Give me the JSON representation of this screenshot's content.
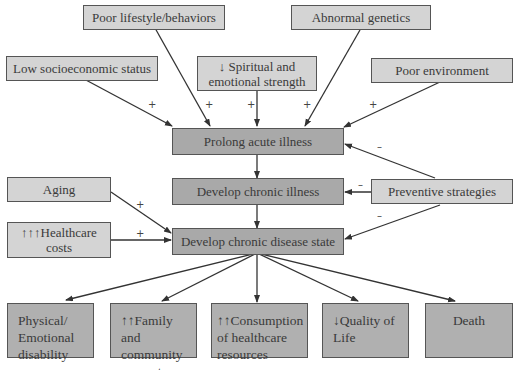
{
  "nodes": {
    "poor_lifestyle": "Poor lifestyle/behaviors",
    "abnormal_genetics": "Abnormal genetics",
    "low_ses": "Low socioeconomic status",
    "spiritual": "↓ Spiritual and emotional strength",
    "poor_environment": "Poor environment",
    "prolong_acute": "Prolong acute illness",
    "develop_chronic_illness": "Develop chronic illness",
    "preventive": "Preventive strategies",
    "aging": "Aging",
    "healthcare_costs": "↑↑↑Healthcare costs",
    "chronic_disease_state": "Develop chronic disease state",
    "physical_disability": "Physical/ Emotional disability",
    "family_support": "↑↑Family and community support care",
    "consumption": "↑↑Consumption of healthcare resources",
    "quality_of_life": "↓Quality of Life",
    "death": "Death"
  },
  "signs": {
    "plus": "+",
    "minus": "–"
  },
  "edges": [
    {
      "from": "low_ses",
      "to": "prolong_acute",
      "sign": "+"
    },
    {
      "from": "poor_lifestyle",
      "to": "prolong_acute",
      "sign": "+"
    },
    {
      "from": "spiritual",
      "to": "prolong_acute",
      "sign": "+"
    },
    {
      "from": "abnormal_genetics",
      "to": "prolong_acute",
      "sign": "+"
    },
    {
      "from": "poor_environment",
      "to": "prolong_acute",
      "sign": "+"
    },
    {
      "from": "preventive",
      "to": "prolong_acute",
      "sign": "–"
    },
    {
      "from": "preventive",
      "to": "develop_chronic_illness",
      "sign": "–"
    },
    {
      "from": "preventive",
      "to": "chronic_disease_state",
      "sign": "–"
    },
    {
      "from": "prolong_acute",
      "to": "develop_chronic_illness",
      "sign": ""
    },
    {
      "from": "develop_chronic_illness",
      "to": "chronic_disease_state",
      "sign": ""
    },
    {
      "from": "aging",
      "to": "chronic_disease_state",
      "sign": "+"
    },
    {
      "from": "healthcare_costs",
      "to": "chronic_disease_state",
      "sign": "+"
    },
    {
      "from": "chronic_disease_state",
      "to": "physical_disability",
      "sign": ""
    },
    {
      "from": "chronic_disease_state",
      "to": "family_support",
      "sign": ""
    },
    {
      "from": "chronic_disease_state",
      "to": "consumption",
      "sign": ""
    },
    {
      "from": "chronic_disease_state",
      "to": "quality_of_life",
      "sign": ""
    },
    {
      "from": "chronic_disease_state",
      "to": "death",
      "sign": ""
    }
  ]
}
